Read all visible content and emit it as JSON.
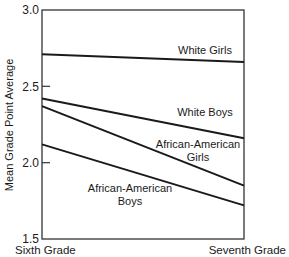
{
  "chart_data": {
    "type": "line",
    "title": "",
    "xlabel": "",
    "ylabel": "Mean Grade Point Average",
    "categories": [
      "Sixth Grade",
      "Seventh Grade"
    ],
    "ylim": [
      1.5,
      3.0
    ],
    "yticks": [
      1.5,
      2.0,
      2.5,
      3.0
    ],
    "ytick_labels": [
      "1.5",
      "2.0",
      "2.5",
      "3.0"
    ],
    "grid": false,
    "legend": "inline labels",
    "series": [
      {
        "name": "White Girls",
        "values": [
          2.71,
          2.66
        ],
        "label_lines": [
          "White Girls"
        ]
      },
      {
        "name": "White Boys",
        "values": [
          2.42,
          2.16
        ],
        "label_lines": [
          "White Boys"
        ]
      },
      {
        "name": "African-American Girls",
        "values": [
          2.37,
          1.85
        ],
        "label_lines": [
          "African-American",
          "Girls"
        ]
      },
      {
        "name": "African-American Boys",
        "values": [
          2.12,
          1.72
        ],
        "label_lines": [
          "African-American",
          "Boys"
        ]
      }
    ],
    "line_color": "#1a1a1a"
  }
}
